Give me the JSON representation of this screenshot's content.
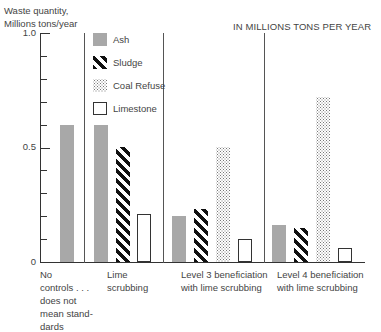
{
  "chart_data": {
    "type": "bar",
    "title": "IN MILLIONS TONS PER YEAR",
    "ylabel": "Waste quantity, Millions tons/year",
    "xlabel": "",
    "ylim": [
      0,
      1.0
    ],
    "yticks": [
      "1.0",
      "0.5",
      "0"
    ],
    "grid": false,
    "legend_position": "inside top-left",
    "categories": [
      "No controls . . . does not mean standards",
      "Lime scrubbing",
      "Level 3 beneficiation with lime scrubbing",
      "Level 4 beneficiation with lime scrubbing"
    ],
    "series": [
      {
        "name": "Ash",
        "values": [
          0.6,
          0.6,
          0.2,
          0.16
        ]
      },
      {
        "name": "Sludge",
        "values": [
          null,
          0.5,
          0.23,
          0.15
        ]
      },
      {
        "name": "Coal Refuse",
        "values": [
          null,
          null,
          0.5,
          0.72
        ]
      },
      {
        "name": "Limestone",
        "values": [
          null,
          0.21,
          0.1,
          0.06
        ]
      }
    ]
  },
  "labels": {
    "ylabel_line1": "Waste quantity,",
    "ylabel_line2": "Millions tons/year",
    "subtitle": "IN MILLIONS TONS PER YEAR",
    "tick_top": "1.0",
    "tick_mid": "0.5",
    "tick_zero": "0",
    "legend": [
      "Ash",
      "Sludge",
      "Coal Refuse",
      "Limestone"
    ],
    "cat0": [
      "No",
      "controls . . .",
      "does not",
      "mean stand-",
      "dards"
    ],
    "cat1": [
      "Lime",
      "scrubbing"
    ],
    "cat2": [
      "Level 3 beneficiation",
      "with lime scrubbing"
    ],
    "cat3": [
      "Level 4 beneficiation",
      "with lime scrubbing"
    ]
  }
}
